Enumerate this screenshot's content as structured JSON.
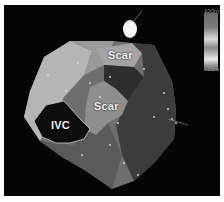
{
  "image": {
    "description": "Grayscale electroanatomical voltage map with scar regions",
    "labels": {
      "scar_upper": "Scar",
      "scar_center": "Scar",
      "ivc": "IVC"
    },
    "color_scale": {
      "max_label": "100m",
      "min_label": "-00m"
    },
    "colors": {
      "background": "#050505",
      "border": "#ffffff",
      "map_light": "#b8b8b8",
      "map_mid": "#7a7a7a",
      "map_dark": "#3a3a3a"
    }
  }
}
